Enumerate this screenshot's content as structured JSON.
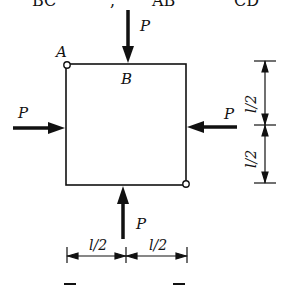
{
  "top_fragment": {
    "parts": [
      "BC",
      ",",
      "AB",
      "CD"
    ]
  },
  "figure": {
    "points": {
      "A": "A",
      "B": "B"
    },
    "forces": {
      "top": "P",
      "left": "P",
      "right": "P",
      "bottom": "P"
    },
    "dimensions": {
      "vertical_upper": "l/2",
      "vertical_lower": "l/2",
      "horizontal_left": "l/2",
      "horizontal_right": "l/2"
    }
  },
  "caption_fragment": ""
}
